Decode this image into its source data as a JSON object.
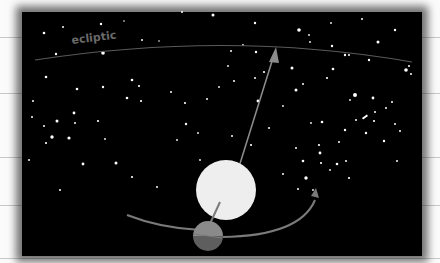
{
  "diagram": {
    "labels": {
      "ecliptic": "ecliptic"
    },
    "colors": {
      "background": "#000000",
      "page": "#fbfbfb",
      "sun": "#eeeeee",
      "earth_top": "#8a8a8a",
      "earth_bottom": "#5e5e5e",
      "orbit": "#7a7a7a",
      "arrow": "#8c8c8c",
      "ecliptic_line": "#5a5a5a"
    },
    "elements": [
      "star field",
      "ecliptic line",
      "sun",
      "earth",
      "earth orbit",
      "direction arrow"
    ]
  }
}
